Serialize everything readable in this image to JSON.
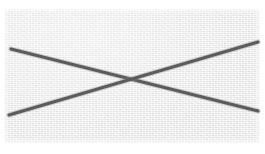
{
  "image": {
    "kind": "scanned-paper-mark",
    "width": 265,
    "height": 154,
    "alt_text": "A large X drawn in dark gray pencil on a light gray textured paper background",
    "page_background_color": "#ffffff"
  },
  "paper": {
    "label": "scanned paper area",
    "fill_color": "#ededed",
    "highlight_color": "#f5f5f5",
    "shadow_color": "#e8e8e8",
    "left": 4,
    "top": 9,
    "width": 256,
    "height": 134
  },
  "marks": {
    "label": "hand drawn X mark",
    "stroke_color": "#5c5c5c",
    "halo_color": "#8d8d8d",
    "stroke_width": 3.1,
    "halo_width": 5.4,
    "intersection": {
      "x": 128,
      "y": 80
    },
    "strokes": [
      {
        "name": "descending-stroke",
        "description": "stroke running from upper left down to lower right",
        "x1": 11,
        "y1": 49,
        "x2": 258,
        "y2": 111
      },
      {
        "name": "ascending-stroke",
        "description": "stroke running from lower left up to upper right",
        "x1": 9,
        "y1": 115,
        "x2": 258,
        "y2": 42
      }
    ]
  }
}
